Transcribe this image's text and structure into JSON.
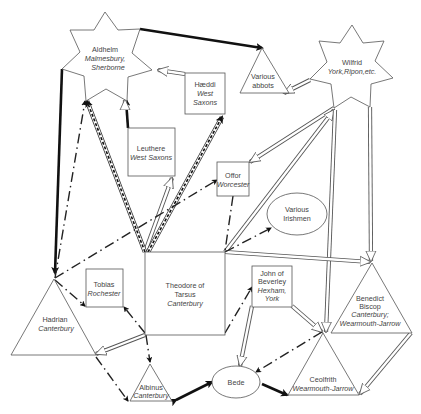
{
  "diagram": {
    "type": "network of scholarly connections",
    "nodes": [
      {
        "id": "aldhelm",
        "shape": "star",
        "name": "Aldhelm",
        "place": "Malmesbury, Sherborne"
      },
      {
        "id": "wilfrid",
        "shape": "star",
        "name": "Wilfrid",
        "place": "York,Ripon,etc."
      },
      {
        "id": "abbots",
        "shape": "triangle",
        "name": "Various abbots",
        "place": ""
      },
      {
        "id": "haeddi",
        "shape": "box",
        "name": "Hæddi",
        "place": "West Saxons"
      },
      {
        "id": "leuthere",
        "shape": "box",
        "name": "Leuthere",
        "place": "West Saxons"
      },
      {
        "id": "offor",
        "shape": "box",
        "name": "Offor",
        "place": "Worcester"
      },
      {
        "id": "irishmen",
        "shape": "ellipse",
        "name": "Various Irishmen",
        "place": ""
      },
      {
        "id": "theodore",
        "shape": "box",
        "name": "Theodore of Tarsus",
        "place": "Canterbury"
      },
      {
        "id": "tobias",
        "shape": "box",
        "name": "Tobias",
        "place": "Rochester"
      },
      {
        "id": "john",
        "shape": "box",
        "name": "John of Beverley",
        "place": "Hexham, York"
      },
      {
        "id": "hadrian",
        "shape": "triangle",
        "name": "Hadrian",
        "place": "Canterbury"
      },
      {
        "id": "benedict",
        "shape": "triangle",
        "name": "Benedict Biscop",
        "place": "Canterbury; Wearmouth-Jarrow"
      },
      {
        "id": "ceolfrith",
        "shape": "triangle",
        "name": "Ceolfrith",
        "place": "Wearmouth-Jarrow"
      },
      {
        "id": "albinus",
        "shape": "triangle",
        "name": "Albinus",
        "place": "Canterbury"
      },
      {
        "id": "bede",
        "shape": "ellipse",
        "name": "Bede",
        "place": ""
      }
    ],
    "edges": [
      {
        "from": "aldhelm",
        "to": "abbots",
        "style": "thick"
      },
      {
        "from": "aldhelm",
        "to": "hadrian",
        "style": "thick"
      },
      {
        "from": "haeddi",
        "to": "aldhelm",
        "style": "hollow"
      },
      {
        "from": "leuthere",
        "to": "aldhelm",
        "style": "thick-hollow"
      },
      {
        "from": "theodore",
        "to": "aldhelm",
        "style": "double-dashed"
      },
      {
        "from": "theodore",
        "to": "haeddi",
        "style": "double-dashed"
      },
      {
        "from": "theodore",
        "to": "leuthere",
        "style": "hollow"
      },
      {
        "from": "wilfrid",
        "to": "abbots",
        "style": "hollow"
      },
      {
        "from": "wilfrid",
        "to": "offor",
        "style": "hollow"
      },
      {
        "from": "theodore",
        "to": "wilfrid",
        "style": "hollow"
      },
      {
        "from": "wilfrid",
        "to": "benedict",
        "style": "hollow"
      },
      {
        "from": "wilfrid",
        "to": "ceolfrith",
        "style": "hollow"
      },
      {
        "from": "theodore",
        "to": "benedict",
        "style": "hollow"
      },
      {
        "from": "benedict",
        "to": "ceolfrith",
        "style": "hollow"
      },
      {
        "from": "john",
        "to": "ceolfrith",
        "style": "hollow"
      },
      {
        "from": "john",
        "to": "bede",
        "style": "hollow"
      },
      {
        "from": "theodore",
        "to": "hadrian",
        "style": "hollow"
      },
      {
        "from": "hadrian",
        "to": "offor",
        "style": "dash-dot"
      },
      {
        "from": "hadrian",
        "to": "aldhelm",
        "style": "dash-dot"
      },
      {
        "from": "theodore",
        "to": "irishmen",
        "style": "dash-dot"
      },
      {
        "from": "hadrian",
        "to": "tobias",
        "style": "dash-dot"
      },
      {
        "from": "theodore",
        "to": "tobias",
        "style": "dash-dot"
      },
      {
        "from": "theodore",
        "to": "albinus",
        "style": "dash-dot"
      },
      {
        "from": "hadrian",
        "to": "albinus",
        "style": "dash-dot"
      },
      {
        "from": "theodore",
        "to": "john",
        "style": "dash-dot"
      },
      {
        "from": "ceolfrith",
        "to": "bede",
        "style": "dash-dot"
      },
      {
        "from": "albinus",
        "to": "bede",
        "style": "thick"
      },
      {
        "from": "bede",
        "to": "ceolfrith",
        "style": "thick"
      },
      {
        "from": "offor",
        "to": "theodore",
        "style": "dash-dot"
      }
    ]
  },
  "labels": {
    "aldhelm": {
      "name": "Aldhelm",
      "place1": "Malmesbury,",
      "place2": "Sherborne"
    },
    "wilfrid": {
      "name": "Wilfrid",
      "place": "York,Ripon,etc."
    },
    "abbots": {
      "line1": "Various",
      "line2": "abbots"
    },
    "haeddi": {
      "name": "Hæddi",
      "place1": "West",
      "place2": "Saxons"
    },
    "leuthere": {
      "name": "Leuthere",
      "place": "West Saxons"
    },
    "offor": {
      "name": "Offor",
      "place": "Worcester"
    },
    "irishmen": {
      "line1": "Various",
      "line2": "Irishmen"
    },
    "theodore": {
      "line1": "Theodore of",
      "line2": "Tarsus",
      "place": "Canterbury"
    },
    "tobias": {
      "name": "Tobias",
      "place": "Rochester"
    },
    "john": {
      "line1": "John of",
      "line2": "Beverley",
      "line3": "Hexham,",
      "line4": "York"
    },
    "hadrian": {
      "name": "Hadrian",
      "place": "Canterbury"
    },
    "benedict": {
      "line1": "Benedict",
      "line2": "Biscop",
      "place1": "Canterbury;",
      "place2": "Wearmouth-Jarrow"
    },
    "ceolfrith": {
      "name": "Ceolfrith",
      "place": "Wearmouth-Jarrow"
    },
    "albinus": {
      "name": "Albinus",
      "place": "Canterbury"
    },
    "bede": {
      "name": "Bede"
    }
  }
}
